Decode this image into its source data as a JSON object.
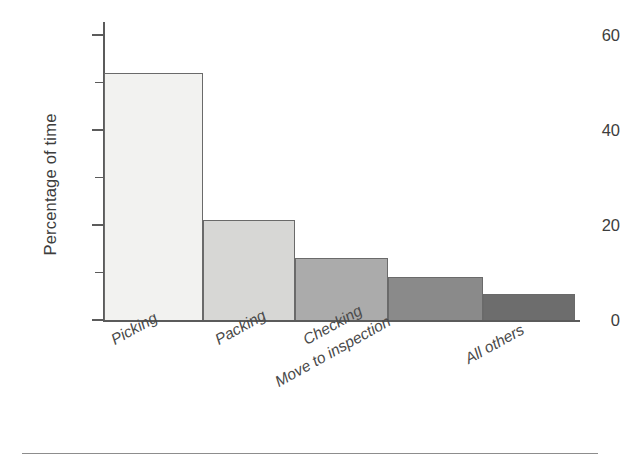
{
  "chart_data": {
    "type": "bar",
    "title": "",
    "subtitle": "",
    "xlabel": "",
    "ylabel": "Percentage of time",
    "categories": [
      "Picking",
      "Packing",
      "Checking",
      "Move to inspection",
      "All others"
    ],
    "values": [
      52,
      21,
      13,
      9,
      5.5
    ],
    "series": [
      {
        "name": "Percentage of time",
        "values": [
          52,
          21,
          13,
          9,
          5.5
        ]
      }
    ],
    "ylim": [
      0,
      62
    ],
    "y_major_ticks": [
      0,
      20,
      40,
      60
    ],
    "y_minor_ticks": [
      10,
      30,
      50
    ],
    "y_tick_labels": [
      "0",
      "20",
      "40",
      "60"
    ],
    "grid": false,
    "legend": false,
    "legend_position": "none",
    "bar_colors": [
      "#f2f2f0",
      "#d7d7d5",
      "#ababab",
      "#8a8a8a",
      "#6d6d6d"
    ],
    "bar_border_color": "#6a6a6a",
    "axis_color": "#5b5b5b",
    "text_color": "#3d3d3d",
    "background": "#ffffff",
    "category_label_rotation_deg": -29,
    "annotations": []
  },
  "axes": {
    "y_title": "Percentage of time",
    "tick_labels": [
      {
        "value": 0,
        "text": "0"
      },
      {
        "value": 20,
        "text": "20"
      },
      {
        "value": 40,
        "text": "40"
      },
      {
        "value": 60,
        "text": "60"
      }
    ]
  },
  "bars": [
    {
      "label": "Picking",
      "value": 52,
      "color": "#f2f2f0"
    },
    {
      "label": "Packing",
      "value": 21,
      "color": "#d7d7d5"
    },
    {
      "label": "Checking",
      "value": 13,
      "color": "#ababab"
    },
    {
      "label": "Move to inspection",
      "value": 9,
      "color": "#8a8a8a"
    },
    {
      "label": "All others",
      "value": 5.5,
      "color": "#6d6d6d"
    }
  ]
}
